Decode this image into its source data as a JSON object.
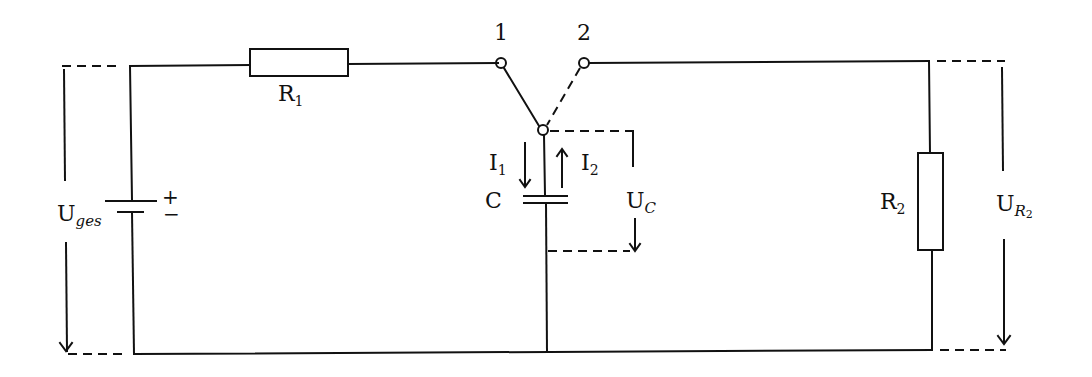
{
  "diagram": {
    "type": "circuit-schematic",
    "components": {
      "battery": {
        "label_main": "U",
        "label_sub": "ges",
        "polarity_plus": "+",
        "polarity_minus": "−"
      },
      "r1": {
        "label_main": "R",
        "label_sub": "1"
      },
      "r2": {
        "label_main": "R",
        "label_sub": "2"
      },
      "capacitor": {
        "label": "C"
      },
      "switch": {
        "pos1": "1",
        "pos2": "2"
      }
    },
    "currents": {
      "i1": {
        "main": "I",
        "sub": "1"
      },
      "i2": {
        "main": "I",
        "sub": "2"
      }
    },
    "voltages": {
      "uc": {
        "main": "U",
        "sub": "C"
      },
      "ur2": {
        "main": "U",
        "sub": "R",
        "subsub": "2"
      }
    },
    "colors": {
      "line": "#111111",
      "background": "#ffffff"
    }
  }
}
